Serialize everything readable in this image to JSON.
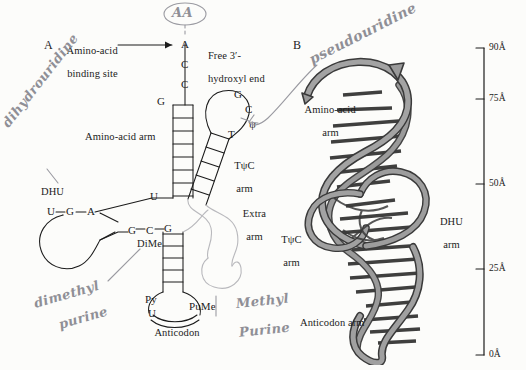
{
  "figure": {
    "background_color": "#fcfcfa",
    "ink_color": "#1b1b1b",
    "ribbon_fill": "#9a9a9a",
    "ribbon_stroke": "#3a3a3a",
    "extra_arm_color": "#b9b9bd",
    "pencil_color": "#8f8f96"
  },
  "panel_a": {
    "letter": "A",
    "labels": {
      "amino_acid_binding_site": "Amino-acid\nbinding site",
      "free_hydroxyl_end": "Free 3′-\nhydroxyl end",
      "amino_acid_arm": "Amino-acid arm",
      "tpsic_arm": "TψC\narm",
      "extra_arm": "Extra\narm",
      "dhu_label": "DHU",
      "dime_label": "DiMe",
      "anticodon": "Anticodon"
    },
    "acceptor_stem_bases": [
      "A",
      "C",
      "C"
    ],
    "acceptor_stem_first_base": "G",
    "tpsic_loop_bases": [
      "G",
      "C",
      "ψ",
      "T"
    ],
    "dhu_loop_bases": [
      "U",
      "G",
      "A"
    ],
    "dhu_stem_junction_base": "U",
    "anticodon_stem_bases": [
      "G",
      "C",
      "G"
    ],
    "anticodon_loop_bases": [
      "Py",
      "U",
      "PuMe"
    ],
    "amino_acid_arm_rungs": 7,
    "tpsic_arm_rungs": 5,
    "anticodon_arm_rungs": 5
  },
  "panel_b": {
    "letter": "B",
    "labels": {
      "amino_acid_arm": "Amino-acid\narm",
      "tpsic_arm": "TψC\narm",
      "dhu_arm": "DHU\narm",
      "anticodon_arm": "Anticodon arm"
    }
  },
  "scale_bar": {
    "ticks": [
      {
        "label": "90Å",
        "value": 90
      },
      {
        "label": "75Å",
        "value": 75
      },
      {
        "label": "50Å",
        "value": 50
      },
      {
        "label": "25Å",
        "value": 25
      },
      {
        "label": "0Å",
        "value": 0
      }
    ],
    "max": 90,
    "min": 0
  },
  "handwritten_annotations": [
    {
      "id": "aa",
      "text": "AA",
      "note": "circled, above acceptor end"
    },
    {
      "id": "dihydrouridine",
      "text": "dihydrouridine"
    },
    {
      "id": "pseudouridine",
      "text": "pseudouridine"
    },
    {
      "id": "dimethyl_purine",
      "text": "dimethyl\npurine"
    },
    {
      "id": "methyl_purine",
      "text": "Methyl\nPurine"
    }
  ]
}
